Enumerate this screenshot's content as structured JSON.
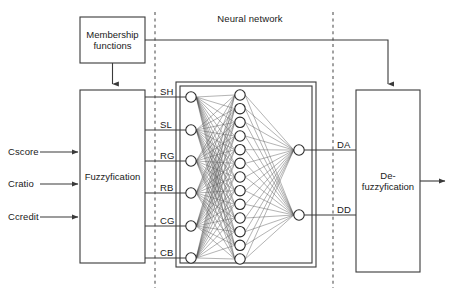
{
  "diagram": {
    "section_title": "Neural network",
    "stroke_color": "#3a3a3a",
    "node_fill": "#ffffff",
    "text_color": "#1a1a1a"
  },
  "blocks": {
    "membership": {
      "label": "Membership\nfunctions",
      "x": 80,
      "y": 17,
      "w": 65,
      "h": 46
    },
    "fuzzyfication": {
      "label": "Fuzzyfication",
      "x": 80,
      "y": 90,
      "w": 65,
      "h": 173
    },
    "defuzzyfication": {
      "label": "De-\nfuzzyfication",
      "x": 356,
      "y": 90,
      "w": 64,
      "h": 182
    }
  },
  "inputs": [
    {
      "label": "Cscore",
      "y": 152
    },
    {
      "label": "Cratio",
      "y": 184
    },
    {
      "label": "Ccredit",
      "y": 217
    }
  ],
  "fuzzy_outputs": [
    {
      "label": "SH",
      "y": 97
    },
    {
      "label": "SL",
      "y": 130
    },
    {
      "label": "RG",
      "y": 161
    },
    {
      "label": "RB",
      "y": 193
    },
    {
      "label": "CG",
      "y": 226
    },
    {
      "label": "CB",
      "y": 258
    }
  ],
  "network_outputs": [
    {
      "label": "DA",
      "y": 150
    },
    {
      "label": "DD",
      "y": 215
    }
  ],
  "network": {
    "frame_outer": {
      "x": 176,
      "y": 82,
      "w": 140,
      "h": 185
    },
    "frame_inner": {
      "x": 180,
      "y": 86,
      "w": 132,
      "h": 177
    },
    "input_nodes_count": 6,
    "hidden_nodes_count": 13,
    "output_nodes_count": 2,
    "input_x": 191,
    "hidden_x": 240,
    "output_x": 299,
    "node_radius": 5.2,
    "hidden_top": 95,
    "hidden_bottom": 259
  },
  "dividers": [
    {
      "name": "left-divider",
      "x": 155
    },
    {
      "name": "right-divider",
      "x": 333
    }
  ],
  "feedback_line": {
    "name": "membership-to-defuzzyfication",
    "from_x": 145,
    "y": 40,
    "to_x": 388,
    "drop_to_y": 90
  },
  "final_output": {
    "from_x": 420,
    "to_x": 447,
    "y": 181
  }
}
